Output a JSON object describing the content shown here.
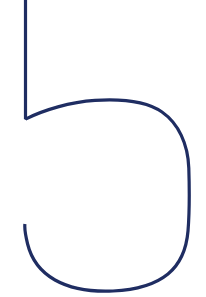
{
  "image": {
    "kind": "handwritten-glyph-drawing",
    "subject": "numeral-five",
    "character": "5",
    "description": "Large hand-drawn outline of the numeral 5 in dark navy ink on a white background",
    "width": 206,
    "height": 297,
    "background_color": "#ffffff",
    "stroke_color": "#1f2d62",
    "stroke_width": 3.2,
    "stroke_style": "single continuous line, butt cap terminals",
    "orientation": "upright"
  },
  "strokes": [
    {
      "name": "stem-and-bowl",
      "label": "Continuous stroke: descending stem, sharp V junction, bowl arc, right shoulder, bottom sweep and left hook",
      "path": "M 25.5 -6 L 25.5 118 L 26.6 118.6 C 44 110 70 102 95 100.4 C 122 98.7 146 101 162 112 C 178.5 123.5 188 144 188.8 168 C 189.6 193 189.4 214 188 231 C 186.4 250 180 264 168 274 C 155 284.6 136 290 113 291 C 90 292 70 288.4 55 280 C 40.6 271.8 31.4 259.4 27.6 244 C 24.6 231.6 24.6 226.6 24.9 224",
      "color": "#1f2d62"
    }
  ],
  "anchors": {
    "stem_top": {
      "x": 25,
      "y": 0
    },
    "stem_bottom_junction": {
      "x": 26,
      "y": 118
    },
    "bowl_apex": {
      "x": 97,
      "y": 101
    },
    "right_extreme": {
      "x": 189,
      "y": 185
    },
    "bottom_extreme": {
      "x": 112,
      "y": 291
    },
    "hook_terminal": {
      "x": 25,
      "y": 224
    }
  }
}
